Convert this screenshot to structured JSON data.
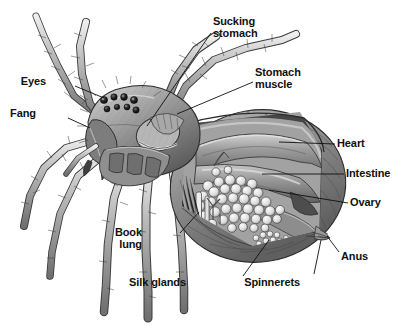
{
  "figure": {
    "style": "grayscale-engraving-illustration",
    "background_color": "#ffffff",
    "line_color": "#101010",
    "width": 413,
    "height": 334
  },
  "labels": [
    {
      "id": "sucking-stomach",
      "text": "Sucking\nstomach",
      "x": 213,
      "y": 16,
      "align": "right",
      "leader": {
        "x1": 211,
        "y1": 33,
        "x2": 147,
        "y2": 126
      }
    },
    {
      "id": "stomach-muscle",
      "text": "Stomach\nmuscle",
      "x": 255,
      "y": 67,
      "align": "right",
      "leader": {
        "x1": 253,
        "y1": 82,
        "x2": 177,
        "y2": 114
      }
    },
    {
      "id": "eyes",
      "text": "Eyes",
      "x": 46,
      "y": 76,
      "align": "left",
      "leader": {
        "x1": 75,
        "y1": 86,
        "x2": 104,
        "y2": 98
      }
    },
    {
      "id": "fang",
      "text": "Fang",
      "x": 36,
      "y": 108,
      "align": "left",
      "leader": {
        "x1": 68,
        "y1": 118,
        "x2": 90,
        "y2": 128
      }
    },
    {
      "id": "heart",
      "text": "Heart",
      "x": 337,
      "y": 138,
      "align": "right",
      "leader": {
        "x1": 335,
        "y1": 144,
        "x2": 279,
        "y2": 142
      }
    },
    {
      "id": "intestine",
      "text": "Intestine",
      "x": 346,
      "y": 168,
      "align": "right",
      "leader": {
        "x1": 344,
        "y1": 174,
        "x2": 262,
        "y2": 174
      }
    },
    {
      "id": "ovary",
      "text": "Ovary",
      "x": 350,
      "y": 197,
      "align": "right",
      "leader": {
        "x1": 348,
        "y1": 203,
        "x2": 269,
        "y2": 190
      }
    },
    {
      "id": "book-lung",
      "text": "Book\nlung",
      "x": 142,
      "y": 227,
      "align": "left",
      "leader": {
        "x1": 180,
        "y1": 233,
        "x2": 199,
        "y2": 212
      }
    },
    {
      "id": "anus",
      "text": "Anus",
      "x": 341,
      "y": 251,
      "align": "right",
      "leader": {
        "x1": 339,
        "y1": 252,
        "x2": 327,
        "y2": 236
      }
    },
    {
      "id": "silk-glands",
      "text": "Silk glands",
      "x": 186,
      "y": 277,
      "align": "left",
      "leader": {
        "x1": 243,
        "y1": 276,
        "x2": 269,
        "y2": 240
      }
    },
    {
      "id": "spinnerets",
      "text": "Spinnerets",
      "x": 300,
      "y": 277,
      "align": "left",
      "leader": {
        "x1": 314,
        "y1": 274,
        "x2": 321,
        "y2": 240
      }
    }
  ],
  "palette": {
    "body_dark": "#5f5f5f",
    "body_mid": "#8c8c8c",
    "body_light": "#c9c9c9",
    "body_pale": "#e3e3e3",
    "organ_mid": "#9a9a9a",
    "organ_dark": "#6a6a6a",
    "egg_fill": "#ececec",
    "outline": "#2b2b2b"
  }
}
